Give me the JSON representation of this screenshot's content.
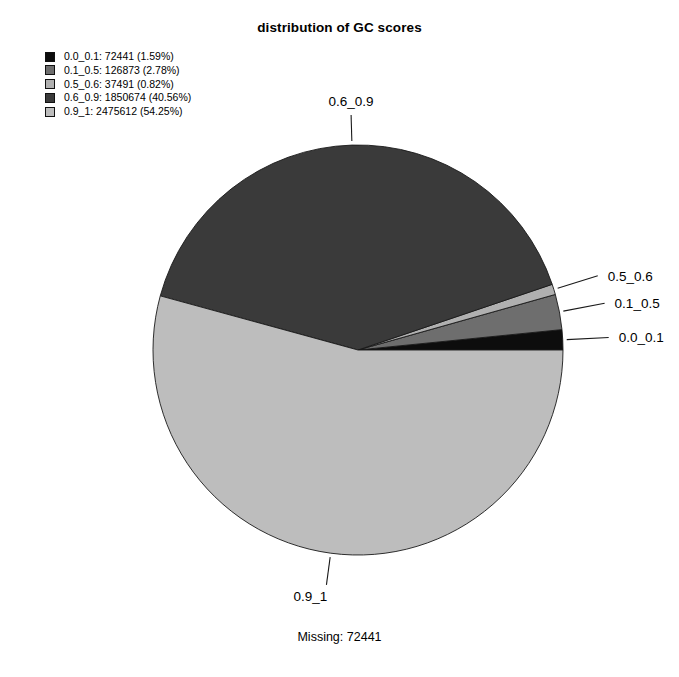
{
  "chart_data": {
    "type": "pie",
    "title": "distribution of GC scores",
    "xlabel": "",
    "ylabel": "",
    "legend_position": "top-left",
    "grid": false,
    "categories": [
      "0.0_0.1",
      "0.1_0.5",
      "0.5_0.6",
      "0.6_0.9",
      "0.9_1"
    ],
    "values": [
      72441,
      126873,
      37491,
      1850674,
      2475612
    ],
    "percentages": [
      1.59,
      2.78,
      0.82,
      40.56,
      54.25
    ],
    "colors": [
      "#0d0d0d",
      "#6e6e6e",
      "#b0b0b0",
      "#3a3a3a",
      "#bdbdbd"
    ],
    "legend_entries": [
      "0.0_0.1: 72441 (1.59%)",
      "0.1_0.5: 126873 (2.78%)",
      "0.5_0.6: 37491 (0.82%)",
      "0.6_0.9: 1850674 (40.56%)",
      "0.9_1: 2475612 (54.25%)"
    ],
    "slice_labels": [
      "0.0_0.1",
      "0.1_0.5",
      "0.5_0.6",
      "0.6_0.9",
      "0.9_1"
    ],
    "annotation": "Missing: 72441",
    "start_angle_deg": 0,
    "direction": "counterclockwise"
  },
  "legend": {
    "items": [
      {
        "label": "0.0_0.1: 72441 (1.59%)",
        "color": "#0d0d0d"
      },
      {
        "label": "0.1_0.5: 126873 (2.78%)",
        "color": "#6e6e6e"
      },
      {
        "label": "0.5_0.6: 37491 (0.82%)",
        "color": "#b0b0b0"
      },
      {
        "label": "0.6_0.9: 1850674 (40.56%)",
        "color": "#3a3a3a"
      },
      {
        "label": "0.9_1: 2475612 (54.25%)",
        "color": "#bdbdbd"
      }
    ]
  },
  "pie_labels": {
    "top": "0.6_0.9",
    "right_upper": "0.5_0.6",
    "right_mid": "0.1_0.5",
    "right_lower": "0.0_0.1",
    "bottom": "0.9_1"
  },
  "footer": {
    "missing": "Missing: 72441"
  }
}
